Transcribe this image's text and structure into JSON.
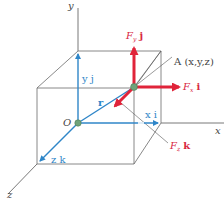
{
  "colors": {
    "axis": "#555555",
    "box": "#6a6a6a",
    "vector_blue": "#2f86c8",
    "force_red": "#e0243a",
    "point_green": "#6fa37a",
    "label_gray": "#444444"
  },
  "axes": {
    "x_label": "x",
    "y_label": "y",
    "z_label": "z"
  },
  "origin": {
    "label": "O"
  },
  "point": {
    "label": "A (x,y,z)"
  },
  "position_vector": {
    "label": "r"
  },
  "components": {
    "x": {
      "label": "x i"
    },
    "y": {
      "label": "y j"
    },
    "z": {
      "label": "z k"
    }
  },
  "forces": {
    "fx": {
      "symbol": "F",
      "sub": "x",
      "unit": "i"
    },
    "fy": {
      "symbol": "F",
      "sub": "y",
      "unit": "j"
    },
    "fz": {
      "symbol": "F",
      "sub": "z",
      "unit": "k"
    }
  }
}
